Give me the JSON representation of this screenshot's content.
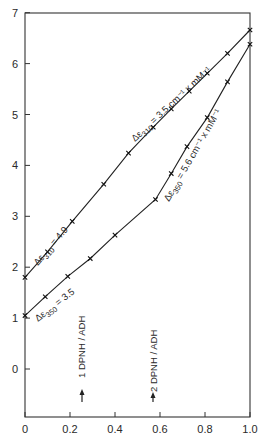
{
  "chart_data": {
    "type": "line",
    "title": "",
    "xlabel": "",
    "ylabel": "",
    "xlim": [
      0,
      1.0
    ],
    "ylim": [
      -0.9,
      7
    ],
    "grid": false,
    "x_ticks": [
      "0",
      "0.2",
      "0.4",
      "0.6",
      "0.8",
      "1.0"
    ],
    "y_ticks": [
      "0",
      "1",
      "2",
      "3",
      "4",
      "5",
      "6",
      "7"
    ],
    "series": [
      {
        "name": "Δε310",
        "x": [
          0,
          0.1,
          0.21,
          0.35,
          0.46,
          0.57,
          0.65,
          0.73,
          0.81,
          0.9,
          1.0
        ],
        "y": [
          1.8,
          2.3,
          2.9,
          3.63,
          4.24,
          4.75,
          5.11,
          5.46,
          5.81,
          6.2,
          6.66
        ]
      },
      {
        "name": "Δε350",
        "x": [
          0,
          0.09,
          0.19,
          0.29,
          0.4,
          0.58,
          0.65,
          0.72,
          0.81,
          0.9,
          1.0
        ],
        "y": [
          1.05,
          1.42,
          1.82,
          2.17,
          2.63,
          3.33,
          3.84,
          4.37,
          4.94,
          5.64,
          6.38
        ]
      }
    ],
    "annotations": [
      {
        "text": "Δε 310 = 4.9",
        "near": "upper line, left segment"
      },
      {
        "text": "Δε 310 = 3.5 cm⁻¹ x mM⁻¹",
        "near": "upper line, right segment"
      },
      {
        "text": "Δε 350 = 3.5",
        "near": "lower line, left segment"
      },
      {
        "text": "Δε 350 = 5.6 cm⁻¹ x mM⁻¹",
        "near": "lower line, right segment"
      },
      {
        "text": "1 DPNH / ADH",
        "x": 0.25,
        "arrow": "up"
      },
      {
        "text": "2 DPNH / ADH",
        "x": 0.57,
        "arrow": "up"
      }
    ]
  },
  "labels": {
    "upper_left": "Δε",
    "upper_left_sub": "310",
    "upper_left_val": " = 4.9",
    "upper_right": "Δε",
    "upper_right_sub": "310",
    "upper_right_val": " = 3.5 cm⁻¹ x mM⁻¹",
    "lower_left": "Δε",
    "lower_left_sub": "350",
    "lower_left_val": " = 3.5",
    "lower_right": "Δε",
    "lower_right_sub": "350",
    "lower_right_val": " = 5.6 cm⁻¹ x mM⁻¹",
    "marker1": "1 DPNH / ADH",
    "marker2": "2 DPNH / ADH"
  }
}
